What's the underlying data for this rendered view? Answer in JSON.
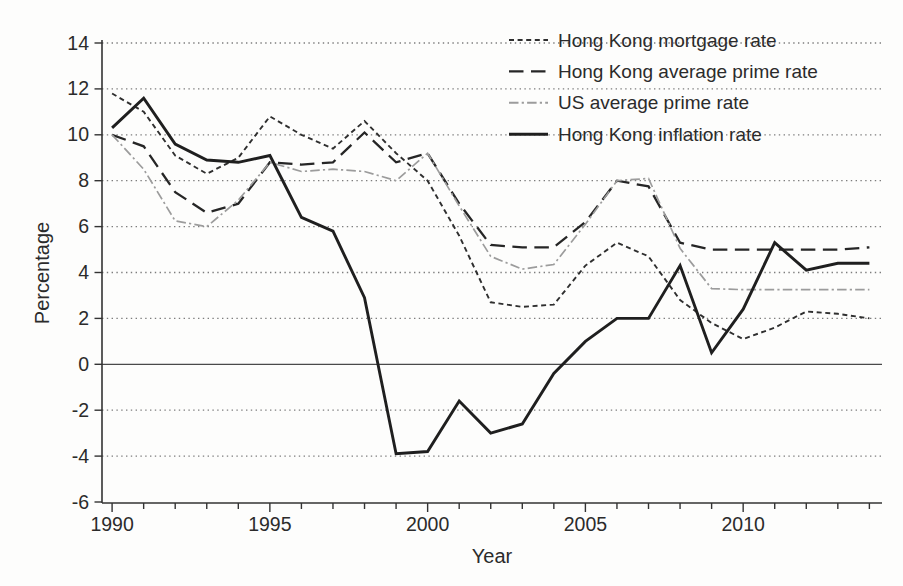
{
  "figure": {
    "background": "#fdfdfc",
    "ink_color": "#2b2b2b",
    "gray_line_color": "#9c9c9c"
  },
  "chart_data": {
    "type": "line",
    "title": "",
    "xlabel": "Year",
    "ylabel": "Percentage",
    "xlim": [
      1989.68,
      2014.4
    ],
    "ylim": [
      -6,
      14
    ],
    "grid": "horizontal dotted at every 2 units, solid line at 0",
    "legend_position": "top-right inside, no border",
    "x_ticks_minor_every": 1,
    "x_tick_labels": [
      {
        "year": 1990,
        "label": "1990"
      },
      {
        "year": 1995,
        "label": "1995"
      },
      {
        "year": 2000,
        "label": "2000"
      },
      {
        "year": 2005,
        "label": "2005"
      },
      {
        "year": 2010,
        "label": "2010"
      }
    ],
    "y_ticks": [
      {
        "value": 14,
        "label": "14"
      },
      {
        "value": 12,
        "label": "12"
      },
      {
        "value": 10,
        "label": "10"
      },
      {
        "value": 8,
        "label": "8"
      },
      {
        "value": 6,
        "label": "6"
      },
      {
        "value": 4,
        "label": "4"
      },
      {
        "value": 2,
        "label": "2"
      },
      {
        "value": 0,
        "label": "0"
      },
      {
        "value": -2,
        "label": "-2"
      },
      {
        "value": -4,
        "label": "-4"
      },
      {
        "value": -6,
        "label": "-6"
      }
    ],
    "x": [
      1990,
      1991,
      1992,
      1993,
      1994,
      1995,
      1996,
      1997,
      1998,
      1999,
      2000,
      2001,
      2002,
      2003,
      2004,
      2005,
      2006,
      2007,
      2008,
      2009,
      2010,
      2011,
      2012,
      2013,
      2014
    ],
    "series": [
      {
        "name": "Hong Kong mortgage rate",
        "style": "short-dash",
        "color": "#2f2f2f",
        "width": 1.9,
        "values": [
          11.8,
          11.0,
          9.1,
          8.3,
          9.0,
          10.8,
          10.0,
          9.4,
          10.6,
          9.2,
          8.0,
          5.6,
          2.7,
          2.5,
          2.6,
          4.3,
          5.3,
          4.7,
          2.8,
          1.8,
          1.1,
          1.6,
          2.3,
          2.2,
          2.0
        ]
      },
      {
        "name": "Hong Kong average prime rate",
        "style": "long-dash",
        "color": "#262626",
        "width": 2.3,
        "values": [
          10.0,
          9.5,
          7.5,
          6.6,
          7.0,
          8.8,
          8.7,
          8.8,
          10.1,
          8.8,
          9.2,
          7.0,
          5.2,
          5.1,
          5.1,
          6.2,
          8.0,
          7.75,
          5.3,
          5.0,
          5.0,
          5.0,
          5.0,
          5.0,
          5.1
        ]
      },
      {
        "name": "US average prime rate",
        "style": "dash-dot",
        "color": "#9c9c9c",
        "width": 1.7,
        "values": [
          10.0,
          8.5,
          6.25,
          6.0,
          7.15,
          8.8,
          8.4,
          8.5,
          8.4,
          8.0,
          9.2,
          6.9,
          4.7,
          4.15,
          4.35,
          6.1,
          8.0,
          8.1,
          5.05,
          3.3,
          3.25,
          3.25,
          3.25,
          3.25,
          3.25
        ]
      },
      {
        "name": "Hong Kong inflation rate",
        "style": "solid",
        "color": "#1f1f1f",
        "width": 2.9,
        "values": [
          10.3,
          11.6,
          9.6,
          8.9,
          8.8,
          9.1,
          6.4,
          5.8,
          2.9,
          -3.9,
          -3.8,
          -1.6,
          -3.0,
          -2.6,
          -0.4,
          1.0,
          2.0,
          2.0,
          4.3,
          0.5,
          2.4,
          5.3,
          4.1,
          4.4,
          4.4
        ]
      }
    ]
  }
}
